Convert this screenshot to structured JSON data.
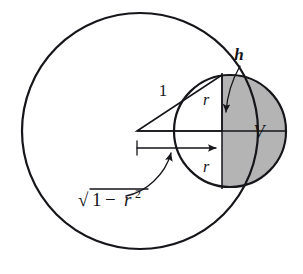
{
  "figure": {
    "background_color": "#ffffff",
    "ink_color": "#15151a",
    "shade_color": "#b4b4b4"
  },
  "labels": {
    "height": "h",
    "radius_top": "r",
    "radius_bottom": "r",
    "volume": "V",
    "unit_radius": "1",
    "sqrt_symbol": "√",
    "sqrt_digit": "1",
    "sqrt_minus": "−",
    "sqrt_var": "r",
    "sqrt_exponent": "2",
    "sqrt_full": "√(1 − r²)"
  },
  "geometry": {
    "big_circle": {
      "cx": 140,
      "cy": 131,
      "r": 118
    },
    "small_circle": {
      "cx": 230,
      "cy": 131,
      "r": 56
    },
    "center_point": {
      "x": 137,
      "y": 131
    },
    "intersection_top": {
      "x": 222,
      "y": 75
    },
    "intersection_bottom": {
      "x": 222,
      "y": 187
    },
    "chord_x": 222,
    "axis_y": 131,
    "dimension_line_y": 148,
    "dimension_from_x": 137,
    "dimension_to_x": 222
  },
  "icons": {
    "arrow_right": "arrow-right-icon",
    "arrow_down": "arrow-down-icon",
    "arrow_up": "arrow-up-icon",
    "tick_mark": "dimension-tick-icon"
  }
}
